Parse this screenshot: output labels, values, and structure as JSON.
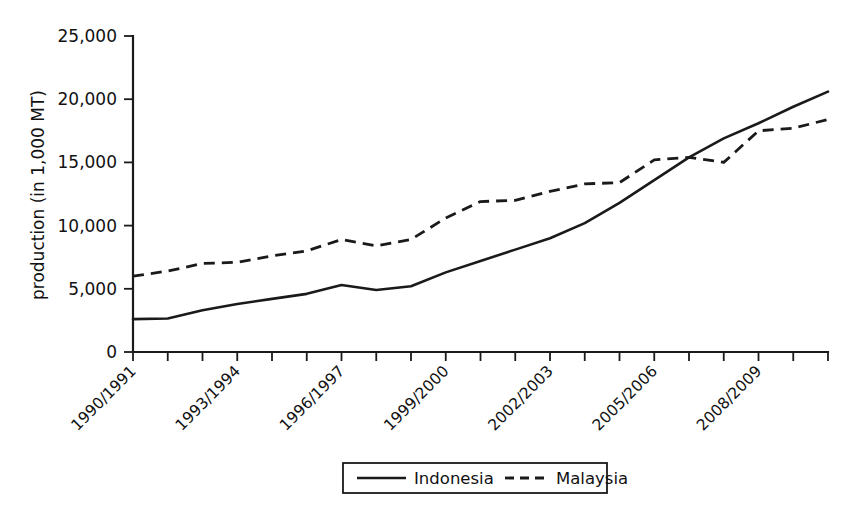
{
  "chart_data": {
    "type": "line",
    "title": "",
    "xlabel": "",
    "ylabel": "production (in 1,000 MT)",
    "ylim": [
      0,
      25000
    ],
    "yticks": [
      0,
      5000,
      10000,
      15000,
      20000,
      25000
    ],
    "ytick_labels": [
      "0",
      "5,000",
      "10,000",
      "15,000",
      "20,000",
      "25,000"
    ],
    "grid": false,
    "legend_position": "bottom-center",
    "x": [
      "1990/1991",
      "1991/1992",
      "1992/1993",
      "1993/1994",
      "1994/1995",
      "1995/1996",
      "1996/1997",
      "1997/1998",
      "1998/1999",
      "1999/2000",
      "2000/2001",
      "2001/2002",
      "2002/2003",
      "2003/2004",
      "2004/2005",
      "2005/2006",
      "2006/2007",
      "2007/2008",
      "2008/2009",
      "2009/2010",
      "2010/2011"
    ],
    "xtick_labels_shown": [
      "1990/1991",
      "1993/1994",
      "1996/1997",
      "1999/2000",
      "2002/2003",
      "2005/2006",
      "2008/2009"
    ],
    "xtick_label_interval": 3,
    "series": [
      {
        "name": "Indonesia",
        "style": "solid",
        "color": "#1a1a1a",
        "values": [
          2600,
          2650,
          3300,
          3800,
          4200,
          4600,
          5300,
          4900,
          5200,
          6300,
          7200,
          8100,
          9000,
          10200,
          11800,
          13600,
          15400,
          16900,
          18100,
          19400,
          20600
        ]
      },
      {
        "name": "Malaysia",
        "style": "dashed",
        "color": "#1a1a1a",
        "values": [
          6000,
          6400,
          7000,
          7100,
          7600,
          8000,
          8900,
          8400,
          8900,
          10600,
          11900,
          12000,
          12700,
          13300,
          13400,
          15200,
          15400,
          15000,
          17500,
          17700,
          18400
        ]
      }
    ]
  },
  "legend": {
    "entries": [
      {
        "label": "Indonesia",
        "style": "solid"
      },
      {
        "label": "Malaysia",
        "style": "dashed"
      }
    ]
  }
}
